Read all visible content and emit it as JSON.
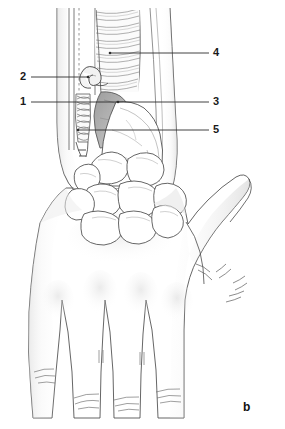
{
  "figure": {
    "panel_label": "b",
    "background_color": "#ffffff",
    "ink_color": "#3a3a3a",
    "label_color": "#1a1a1a",
    "width": 285,
    "height": 429,
    "view": "dorsal view of right hand and wrist"
  },
  "callouts": [
    {
      "id": "callout-2",
      "number": "2",
      "label_x": 20,
      "label_y": 71,
      "line_y": 77,
      "line_x1": 31,
      "line_x2": 88,
      "side": "left",
      "target": "looping-tendon"
    },
    {
      "id": "callout-1",
      "number": "1",
      "label_x": 20,
      "label_y": 96,
      "line_y": 102,
      "line_x1": 31,
      "line_x2": 118,
      "side": "left",
      "target": "tendon-sheath"
    },
    {
      "id": "callout-4",
      "number": "4",
      "label_x": 213,
      "label_y": 47,
      "line_y": 53,
      "line_x1": 110,
      "line_x2": 209,
      "side": "right",
      "target": "muscle-belly-striations"
    },
    {
      "id": "callout-3",
      "number": "3",
      "label_x": 213,
      "label_y": 96,
      "line_y": 102,
      "line_x1": 118,
      "line_x2": 209,
      "side": "right",
      "target": "distal-radius-shaded"
    },
    {
      "id": "callout-5",
      "number": "5",
      "label_x": 213,
      "label_y": 124,
      "line_y": 130,
      "line_x1": 78,
      "line_x2": 209,
      "side": "right",
      "target": "ulnar-styloid-region"
    }
  ],
  "anatomy": {
    "regions": [
      "forearm",
      "wrist",
      "carpal-bones",
      "dorsum-of-hand",
      "thumb",
      "index-finger",
      "middle-finger",
      "ring-finger",
      "little-finger"
    ]
  }
}
